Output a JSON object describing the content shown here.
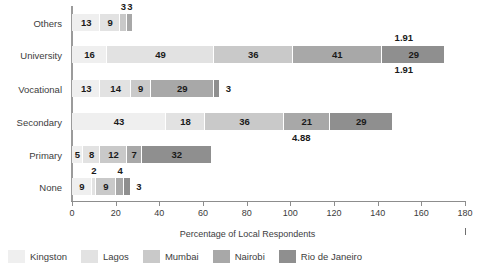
{
  "chart_data": {
    "type": "bar",
    "orientation": "horizontal",
    "stacked": true,
    "title": "",
    "xlabel": "Percentage of Local Respondents",
    "ylabel": "",
    "xlim": [
      0,
      180
    ],
    "xticks": [
      0,
      20,
      40,
      60,
      80,
      100,
      120,
      140,
      160,
      180
    ],
    "grid": false,
    "legend_position": "bottom-left",
    "categories": [
      "Others",
      "University",
      "Vocational",
      "Secondary",
      "Primary",
      "None"
    ],
    "series": [
      {
        "name": "Kingston",
        "color": "#efefef",
        "values": [
          13,
          16,
          13,
          43,
          5,
          9
        ]
      },
      {
        "name": "Lagos",
        "color": "#e2e2e2",
        "values": [
          9,
          49,
          14,
          18,
          8,
          2
        ]
      },
      {
        "name": "Mumbai",
        "color": "#c9c9c9",
        "values": [
          3,
          36,
          9,
          36,
          12,
          9
        ]
      },
      {
        "name": "Nairobi",
        "color": "#a8a8a8",
        "values": [
          3,
          41,
          29,
          21,
          7,
          4
        ]
      },
      {
        "name": "Rio de Janeiro",
        "color": "#8f8f8f",
        "values": [
          0,
          29,
          3,
          29,
          32,
          3
        ]
      }
    ],
    "annotations": [
      {
        "text": "1.91",
        "x": 152,
        "category": "University",
        "position": "above"
      },
      {
        "text": "1.91",
        "x": 152,
        "category": "University",
        "position": "below"
      },
      {
        "text": "4.88",
        "x": 105,
        "category": "Secondary",
        "position": "below"
      }
    ]
  },
  "axis": {
    "tick_labels": [
      "0",
      "20",
      "40",
      "60",
      "80",
      "100",
      "120",
      "140",
      "160",
      "180"
    ],
    "title": "Percentage of Local Respondents"
  },
  "categories": {
    "items": [
      {
        "label": "Others"
      },
      {
        "label": "University"
      },
      {
        "label": "Vocational"
      },
      {
        "label": "Secondary"
      },
      {
        "label": "Primary"
      },
      {
        "label": "None"
      }
    ]
  },
  "legend": {
    "items": [
      {
        "label": "Kingston",
        "color": "#efefef"
      },
      {
        "label": "Lagos",
        "color": "#e2e2e2"
      },
      {
        "label": "Mumbai",
        "color": "#c9c9c9"
      },
      {
        "label": "Nairobi",
        "color": "#a8a8a8"
      },
      {
        "label": "Rio de Janeiro",
        "color": "#8f8f8f"
      }
    ]
  },
  "bar_labels": {
    "others": [
      "13",
      "9",
      "3",
      "3"
    ],
    "university": [
      "16",
      "49",
      "36",
      "41",
      "29"
    ],
    "vocational": [
      "13",
      "14",
      "9",
      "29",
      "3"
    ],
    "secondary": [
      "43",
      "18",
      "36",
      "21",
      "29"
    ],
    "primary": [
      "5",
      "8",
      "12",
      "7",
      "32"
    ],
    "none": [
      "9",
      "2",
      "9",
      "4",
      "3"
    ]
  },
  "annotations": {
    "university_above": "1.91",
    "university_below": "1.91",
    "secondary_below": "4.88"
  }
}
